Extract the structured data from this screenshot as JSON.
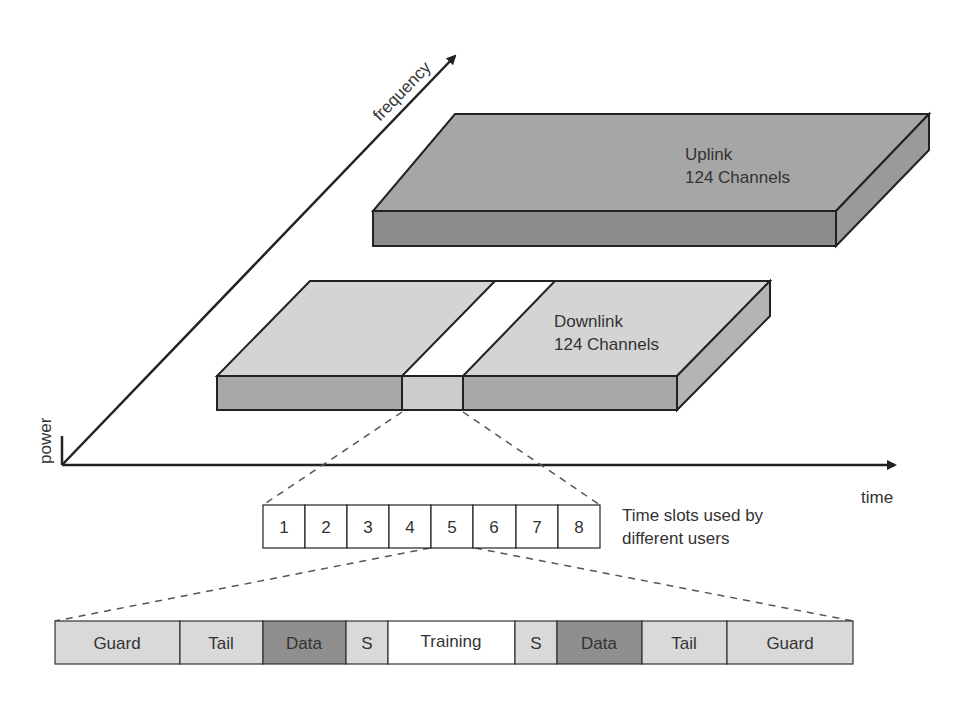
{
  "axes": {
    "frequency_label": "frequency",
    "power_label": "power",
    "time_label": "time"
  },
  "uplink": {
    "title": "Uplink",
    "subtitle": "124 Channels",
    "colors": {
      "top": "#a6a6a6",
      "front": "#8c8c8c",
      "side": "#9a9a9a"
    }
  },
  "downlink": {
    "title": "Downlink",
    "subtitle": "124 Channels",
    "colors": {
      "top": "#d4d4d4",
      "front": "#a8a8a8",
      "side": "#b4b4b4",
      "highlight_top": "#ffffff",
      "highlight_front": "#cccccc"
    }
  },
  "time_slots": {
    "labels": [
      "1",
      "2",
      "3",
      "4",
      "5",
      "6",
      "7",
      "8"
    ],
    "caption_line1": "Time slots used by",
    "caption_line2": "different users"
  },
  "burst": {
    "fields": [
      {
        "label": "Guard",
        "color": "#d9d9d9"
      },
      {
        "label": "Tail",
        "color": "#d9d9d9"
      },
      {
        "label": "Data",
        "color": "#8f8f8f"
      },
      {
        "label": "S",
        "color": "#d9d9d9"
      },
      {
        "label": "Training",
        "color": "#ffffff"
      },
      {
        "label": "S",
        "color": "#d9d9d9"
      },
      {
        "label": "Data",
        "color": "#8f8f8f"
      },
      {
        "label": "Tail",
        "color": "#d9d9d9"
      },
      {
        "label": "Guard",
        "color": "#d9d9d9"
      }
    ]
  }
}
